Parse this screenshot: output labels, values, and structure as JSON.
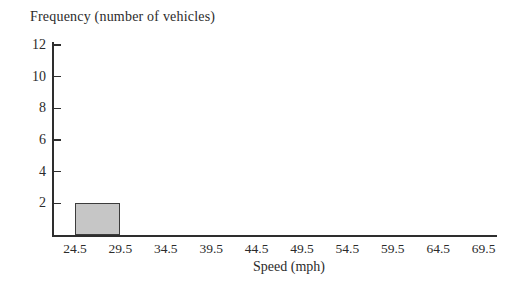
{
  "chart_data": {
    "type": "bar",
    "title": "Frequency (number of vehicles)",
    "xlabel": "Speed (mph)",
    "ylabel": "Frequency (number of vehicles)",
    "categories": [
      "24.5",
      "29.5",
      "34.5",
      "39.5",
      "44.5",
      "49.5",
      "54.5",
      "59.5",
      "64.5",
      "69.5"
    ],
    "y_ticks": [
      2,
      4,
      6,
      8,
      10,
      12
    ],
    "ylim": [
      0,
      12
    ],
    "bars": [
      {
        "x_start": "24.5",
        "x_end": "29.5",
        "value": 2
      }
    ],
    "grid": "off",
    "legend": "none",
    "colors": {
      "bar_fill": "#c6c6c6",
      "bar_border": "#3c3c3c",
      "axis": "#2e2e2e",
      "text": "#2b2b2b",
      "background": "#ffffff"
    }
  }
}
